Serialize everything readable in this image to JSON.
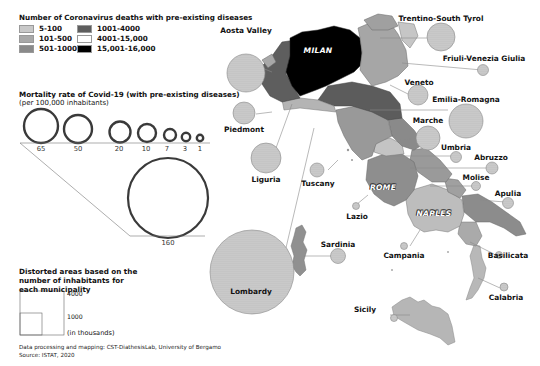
{
  "legend_deaths": {
    "title": "Number of Coronavirus deaths with pre-existing diseases",
    "classes": [
      {
        "label": "5-100",
        "color": "#c8c8c8"
      },
      {
        "label": "101-500",
        "color": "#a8a8a8"
      },
      {
        "label": "501-1000",
        "color": "#8a8a8a"
      },
      {
        "label": "1001-4000",
        "color": "#5e5e5e"
      },
      {
        "label": "4001-15,000",
        "color": "#ffffff"
      },
      {
        "label": "15,001-16,000",
        "color": "#000000"
      }
    ]
  },
  "legend_mortality": {
    "title": "Mortality rate of Covid-19 (with pre-existing diseases)",
    "subtitle": "(per 100,000 inhabitants)",
    "rings": [
      {
        "value": "65"
      },
      {
        "value": "50"
      },
      {
        "value": "20"
      },
      {
        "value": "10"
      },
      {
        "value": "7"
      },
      {
        "value": "3"
      },
      {
        "value": "1"
      },
      {
        "value": "160"
      }
    ]
  },
  "legend_area": {
    "title_line1": "Distorted areas based on the",
    "title_line2": "number of inhabitants for",
    "title_line3": "each municipality",
    "large_value": "4000",
    "small_value": "1000",
    "unit": "(in thousands)"
  },
  "footer": {
    "credit": "Data processing and mapping: CST-DiathesisLab, University of Bergamo",
    "source": "Source: ISTAT, 2020"
  },
  "cities": {
    "milan": "MILAN",
    "rome": "ROME",
    "naples": "NAPLES"
  },
  "regions": [
    {
      "name": "Aosta Valley"
    },
    {
      "name": "Piedmont"
    },
    {
      "name": "Liguria"
    },
    {
      "name": "Lombardy"
    },
    {
      "name": "Trentino-South Tyrol"
    },
    {
      "name": "Friuli-Venezia Giulia"
    },
    {
      "name": "Veneto"
    },
    {
      "name": "Emilia-Romagna"
    },
    {
      "name": "Marche"
    },
    {
      "name": "Umbria"
    },
    {
      "name": "Tuscany"
    },
    {
      "name": "Abruzzo"
    },
    {
      "name": "Lazio"
    },
    {
      "name": "Molise"
    },
    {
      "name": "Apulia"
    },
    {
      "name": "Sardinia"
    },
    {
      "name": "Campania"
    },
    {
      "name": "Basilicata"
    },
    {
      "name": "Calabria"
    },
    {
      "name": "Sicily"
    }
  ]
}
